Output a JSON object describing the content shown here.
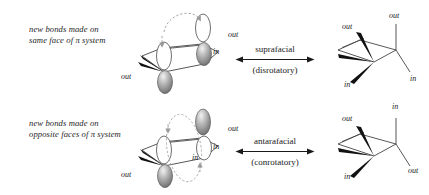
{
  "figure": {
    "title_visible": false,
    "ink_color": "#1a1a1a",
    "orbital_shaded_color": "#8d8d8d",
    "orbital_empty_color": "#ffffff",
    "dashed_arrow_color": "#9a9a9a"
  },
  "rows": [
    {
      "id": "suprafacial",
      "caption": {
        "line1": "new bonds made on",
        "line2": "same face of π system"
      },
      "reactant": {
        "name": "pi-system-orbitals-disrotatory",
        "labels": [
          {
            "text": "out",
            "pos": "right-upper"
          },
          {
            "text": "in",
            "pos": "right-lower"
          },
          {
            "text": "out",
            "pos": "left-lower"
          },
          {
            "text": "in",
            "pos": "left-upper"
          }
        ],
        "rotation_arrows": 2,
        "rotation_style": "dashed-curved-same-direction"
      },
      "arrow": {
        "top_label": "suprafacial",
        "bottom_label": "(disrotatory)",
        "style": "double-headed"
      },
      "product": {
        "name": "cyclobutene-product-disrotatory",
        "labels": [
          {
            "text": "out",
            "pos": "upper-left"
          },
          {
            "text": "out",
            "pos": "upper-right"
          },
          {
            "text": "in",
            "pos": "lower-right"
          },
          {
            "text": "in",
            "pos": "lower-left"
          }
        ]
      }
    },
    {
      "id": "antarafacial",
      "caption": {
        "line1": "new bonds made on",
        "line2": "opposite faces of π system"
      },
      "reactant": {
        "name": "pi-system-orbitals-conrotatory",
        "labels": [
          {
            "text": "out",
            "pos": "right-upper"
          },
          {
            "text": "in",
            "pos": "right-lower"
          },
          {
            "text": "in",
            "pos": "center-lower"
          },
          {
            "text": "out",
            "pos": "left-lower"
          }
        ],
        "rotation_arrows": 2,
        "rotation_style": "dashed-elliptical-loop"
      },
      "arrow": {
        "top_label": "antarafacial",
        "bottom_label": "(conrotatory)",
        "style": "double-headed"
      },
      "product": {
        "name": "cyclobutene-product-conrotatory",
        "labels": [
          {
            "text": "out",
            "pos": "upper-left"
          },
          {
            "text": "in",
            "pos": "upper-right"
          },
          {
            "text": "out",
            "pos": "lower-right"
          },
          {
            "text": "in",
            "pos": "lower-left"
          }
        ]
      }
    }
  ]
}
